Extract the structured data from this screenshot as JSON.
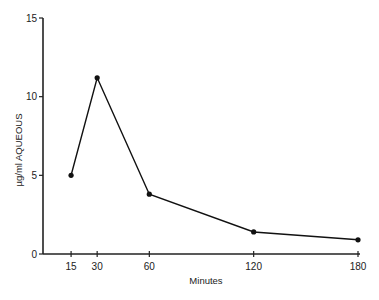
{
  "chart_data": {
    "type": "line",
    "title": "",
    "xlabel": "Minutes",
    "ylabel": "µg/ml  AQUEOUS",
    "x_ticks": [
      15,
      30,
      60,
      120,
      180
    ],
    "y_ticks": [
      0,
      5,
      10,
      15
    ],
    "xlim": [
      0,
      180
    ],
    "ylim": [
      0,
      15
    ],
    "grid": false,
    "series": [
      {
        "name": "Aqueous concentration",
        "x": [
          15,
          30,
          60,
          120,
          180
        ],
        "y": [
          5.0,
          11.2,
          3.8,
          1.4,
          0.9
        ]
      }
    ]
  }
}
